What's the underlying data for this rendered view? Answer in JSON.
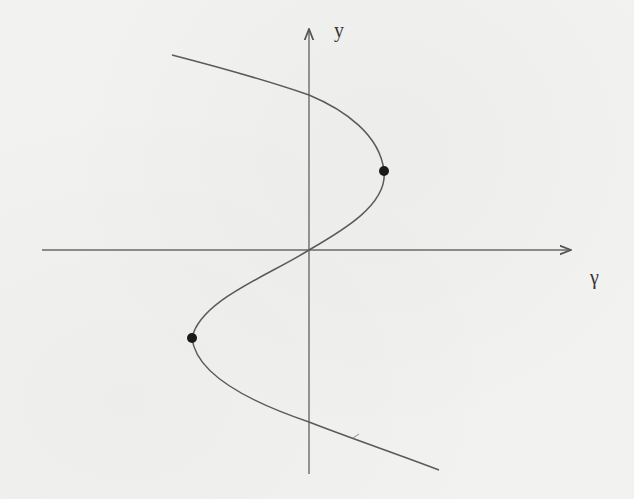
{
  "figure": {
    "axes": {
      "horizontal": {
        "label": "γ",
        "from": [
          42,
          250
        ],
        "to": [
          572,
          250
        ]
      },
      "vertical": {
        "label": "y",
        "from": [
          309,
          474
        ],
        "to": [
          309,
          28
        ]
      }
    },
    "curve": {
      "description": "S-shaped curve of y versus γ with two fold (turning) points",
      "points": [
        [
          172,
          55
        ],
        [
          309,
          95
        ],
        [
          384,
          171
        ],
        [
          309,
          250
        ],
        [
          192,
          338
        ],
        [
          309,
          422
        ],
        [
          439,
          470
        ]
      ]
    },
    "markers": [
      {
        "name": "upper-fold-point",
        "x": 384,
        "y": 171
      },
      {
        "name": "lower-fold-point",
        "x": 192,
        "y": 338
      }
    ],
    "colors": {
      "line": "#555555",
      "marker": "#1a1a1a",
      "background": "#f2f2f0",
      "text": "#333333"
    }
  },
  "labels": {
    "y_axis": "y",
    "x_axis": "γ"
  }
}
